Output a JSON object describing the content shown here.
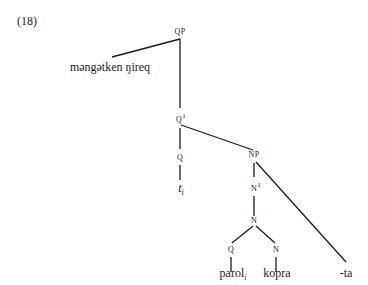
{
  "example_number": "(18)",
  "nodes": {
    "qp": "QP",
    "q1": "Q",
    "q1_bar": "1",
    "q": "Q",
    "np": "NP",
    "n1": "N",
    "n1_bar": "1",
    "n": "N",
    "q_low": "Q",
    "n_low": "N"
  },
  "leaves": {
    "spec": "məngətken ŋireq",
    "trace": "t",
    "trace_index": "i",
    "parol": "parol",
    "parol_index": "i",
    "kopra": "kopra",
    "ta": "-ta"
  },
  "colors": {
    "line": "#1a1a1a",
    "text": "#1a1a1a"
  }
}
